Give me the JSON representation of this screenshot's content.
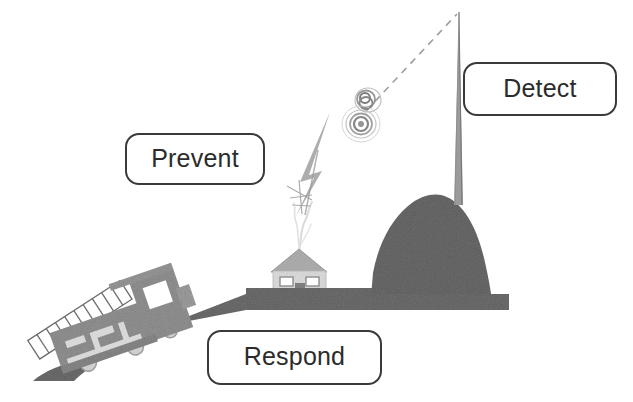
{
  "diagram": {
    "title": "Prevent Detect Respond",
    "background_color": "#ffffff",
    "labels": [
      {
        "id": "prevent",
        "text": "Prevent",
        "x": 125,
        "y": 133,
        "width": 140,
        "height": 52
      },
      {
        "id": "detect",
        "text": "Detect",
        "x": 463,
        "y": 62,
        "width": 154,
        "height": 54
      },
      {
        "id": "respond",
        "text": "Respond",
        "x": 207,
        "y": 330,
        "width": 175,
        "height": 55
      }
    ],
    "label_style": {
      "border_color": "#3a3a3a",
      "fill_color": "#ffffff",
      "text_color": "#2b2b2b",
      "corner_radius": 14
    },
    "scene_elements": [
      {
        "id": "ground",
        "name": "sloping-ground",
        "color": "#6e6e6e"
      },
      {
        "id": "mountain",
        "name": "mountain-hill",
        "color": "#6b6b6b"
      },
      {
        "id": "tower",
        "name": "radio-tower",
        "color": "#8a8a8a"
      },
      {
        "id": "house",
        "name": "house-building",
        "color": "#bdbdbd"
      },
      {
        "id": "smoke",
        "name": "smoke-plume",
        "color": "#c9c9c9"
      },
      {
        "id": "lightning",
        "name": "lightning-bolt",
        "color": "#a8a8a8"
      },
      {
        "id": "signal-rings",
        "name": "radio-signal-rings",
        "color": "#9a9a9a"
      },
      {
        "id": "signal-path",
        "name": "dashed-signal-path",
        "color": "#9a9a9a"
      },
      {
        "id": "train",
        "name": "derailed-train",
        "color": "#8f8f8f"
      },
      {
        "id": "ladder",
        "name": "ladder",
        "color": "#fdfdfd"
      }
    ],
    "colors": {
      "ground": "#6e6e6e",
      "mountain": "#6b6b6b",
      "house_wall": "#dcdcdc",
      "house_roof": "#b3b3b3",
      "train_body": "#949494",
      "outline": "#3a3a3a",
      "signal": "#9a9a9a"
    }
  }
}
